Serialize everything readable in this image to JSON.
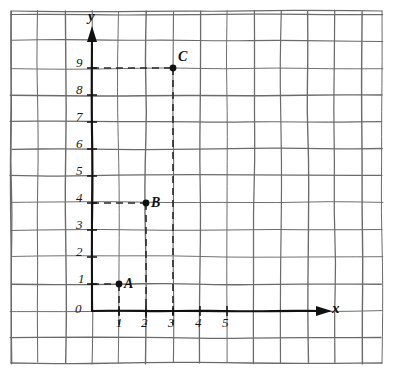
{
  "figure": {
    "kind": "coordinate-plane-graph-paper",
    "axis_labels": {
      "x": "x",
      "y": "y"
    },
    "origin_label": "0"
  },
  "chart_data": {
    "type": "scatter",
    "title": "",
    "xlabel": "x",
    "ylabel": "y",
    "xlim": [
      0,
      5
    ],
    "ylim": [
      0,
      9
    ],
    "grid": true,
    "legend": "none",
    "xticks": [
      "0",
      "1",
      "2",
      "3",
      "4",
      "5"
    ],
    "yticks": [
      "0",
      "1",
      "2",
      "3",
      "4",
      "5",
      "6",
      "7",
      "8",
      "9"
    ],
    "points": [
      {
        "label": "A",
        "x": 1,
        "y": 1
      },
      {
        "label": "B",
        "x": 2,
        "y": 4
      },
      {
        "label": "C",
        "x": 3,
        "y": 9
      }
    ],
    "annotations": [
      "dashed guide lines from each point to both axes"
    ]
  },
  "colors": {
    "grid": "#6b6b6b",
    "axis": "#111111",
    "point": "#111111",
    "dash": "#2a2a2a",
    "background": "#ffffff"
  }
}
